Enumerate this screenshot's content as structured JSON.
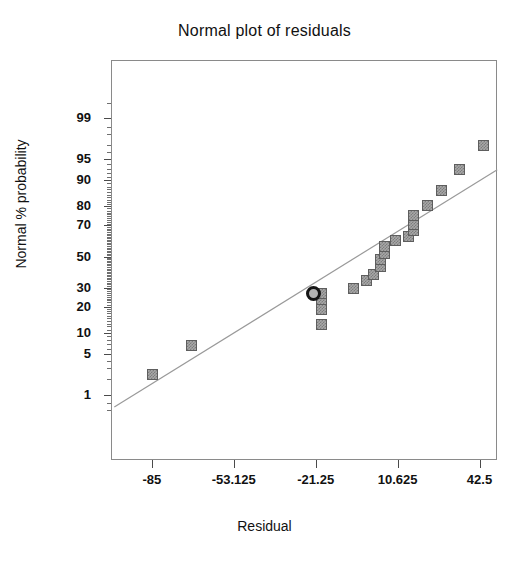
{
  "chart_data": {
    "type": "scatter",
    "title": "Normal plot of residuals",
    "xlabel": "Residual",
    "ylabel": "Normal % probability",
    "grid": false,
    "legend": null,
    "xlim": [
      -100.9,
      49.3
    ],
    "xticks": [
      -85,
      -53.125,
      -21.25,
      10.625,
      42.5
    ],
    "xtick_labels": [
      "-85",
      "-53.125",
      "-21.25",
      "10.625",
      "42.5"
    ],
    "yscale": "normal-probability",
    "yticks": [
      1,
      5,
      10,
      20,
      30,
      50,
      70,
      80,
      90,
      95,
      99
    ],
    "ytick_labels": [
      "99",
      "95",
      "90",
      "80",
      "70",
      "50",
      "30",
      "20",
      "10",
      "5",
      "1"
    ],
    "series": [
      {
        "name": "residual-points",
        "marker": "square",
        "color": "#a8a8a8",
        "points": [
          {
            "x": -85.0,
            "y": 2.5
          },
          {
            "x": -70.0,
            "y": 7.0
          },
          {
            "x": -19.5,
            "y": 13.0
          },
          {
            "x": -19.5,
            "y": 19.0
          },
          {
            "x": -19.5,
            "y": 24.0
          },
          {
            "x": -19.5,
            "y": 27.5
          },
          {
            "x": -7.0,
            "y": 30.0
          },
          {
            "x": -2.0,
            "y": 35.0
          },
          {
            "x": 1.0,
            "y": 39.0
          },
          {
            "x": 3.5,
            "y": 44.0
          },
          {
            "x": 3.5,
            "y": 48.5
          },
          {
            "x": 5.0,
            "y": 52.5
          },
          {
            "x": 5.0,
            "y": 57.0
          },
          {
            "x": 9.5,
            "y": 61.0
          },
          {
            "x": 14.5,
            "y": 63.5
          },
          {
            "x": 16.5,
            "y": 67.5
          },
          {
            "x": 16.5,
            "y": 71.0
          },
          {
            "x": 16.5,
            "y": 76.0
          },
          {
            "x": 22.0,
            "y": 81.0
          },
          {
            "x": 27.5,
            "y": 87.0
          },
          {
            "x": 34.5,
            "y": 93.0
          },
          {
            "x": 43.5,
            "y": 97.0
          }
        ]
      }
    ],
    "highlighted_point": {
      "name": "highlighted-residual",
      "marker": "circle-outline",
      "x": -22.5,
      "y": 27.0
    },
    "reference_line": {
      "name": "normal-reference-line",
      "color": "#9a9a9a",
      "x_start": -100.0,
      "y_start": 0.6,
      "x_end": 49.0,
      "y_end": 93.0
    }
  }
}
